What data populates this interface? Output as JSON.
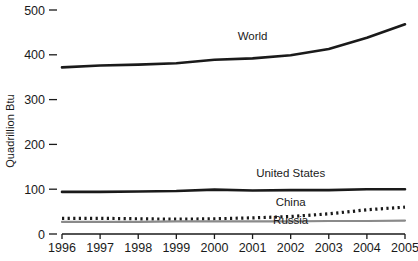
{
  "chart_data": {
    "type": "line",
    "title": "",
    "xlabel": "",
    "ylabel": "Quadrillion Btu",
    "x": [
      1996,
      1997,
      1998,
      1999,
      2000,
      2001,
      2002,
      2003,
      2004,
      2005
    ],
    "xtick_labels": [
      "1996",
      "1997",
      "1998",
      "1999",
      "2000",
      "2001",
      "2002",
      "2003",
      "2004",
      "2005"
    ],
    "ytick_labels": [
      "0",
      "100",
      "200",
      "300",
      "400",
      "500"
    ],
    "yticks": [
      0,
      100,
      200,
      300,
      400,
      500
    ],
    "ylim": [
      0,
      500
    ],
    "xlim": [
      1996,
      2005
    ],
    "grid": false,
    "legend_position": "inline-labels",
    "series": [
      {
        "name": "World",
        "label": "World",
        "style": "solid-thick",
        "color": "#1a1a1a",
        "values": [
          372,
          376,
          378,
          381,
          389,
          392,
          399,
          413,
          438,
          468
        ],
        "label_x": 2001,
        "label_y": 432
      },
      {
        "name": "United States",
        "label": "United States",
        "style": "solid-thick",
        "color": "#1a1a1a",
        "values": [
          94,
          94,
          95,
          96,
          99,
          97,
          98,
          98,
          100,
          100
        ],
        "label_x": 2002,
        "label_y": 128
      },
      {
        "name": "China",
        "label": "China",
        "style": "dotted-thick",
        "color": "#1a1a1a",
        "values": [
          35,
          35,
          34,
          33,
          34,
          36,
          39,
          45,
          54,
          60
        ],
        "label_x": 2002,
        "label_y": 62
      },
      {
        "name": "Russia",
        "label": "Russia",
        "style": "solid-gray",
        "color": "#8a8a8a",
        "values": [
          27,
          27,
          27,
          28,
          28,
          28,
          28,
          29,
          29,
          30
        ],
        "label_x": 2002,
        "label_y": 22
      }
    ],
    "axis_color": "#1a1a1a"
  }
}
